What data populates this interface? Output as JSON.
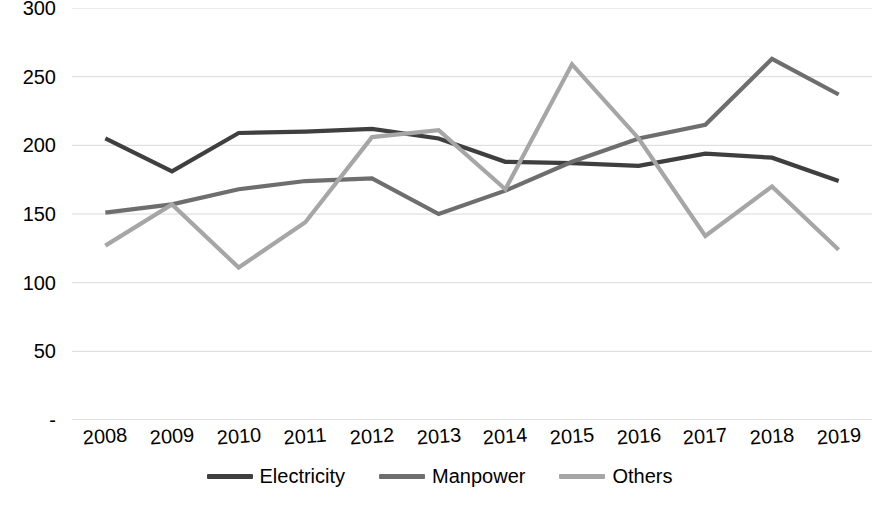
{
  "chart_data": {
    "type": "line",
    "title": "",
    "subtitle": "",
    "xlabel": "",
    "ylabel": "",
    "categories": [
      "2008",
      "2009",
      "2010",
      "2011",
      "2012",
      "2013",
      "2014",
      "2015",
      "2016",
      "2017",
      "2018",
      "2019"
    ],
    "series": [
      {
        "name": "Electricity",
        "color": "#3f3f3f",
        "values": [
          205,
          181,
          209,
          210,
          212,
          205,
          188,
          187,
          185,
          194,
          191,
          174
        ]
      },
      {
        "name": "Manpower",
        "color": "#6e6e6e",
        "values": [
          151,
          157,
          168,
          174,
          176,
          150,
          167,
          188,
          205,
          215,
          263,
          237
        ]
      },
      {
        "name": "Others",
        "color": "#a6a6a6",
        "values": [
          127,
          157,
          111,
          144,
          206,
          211,
          168,
          259,
          205,
          134,
          170,
          124
        ]
      }
    ],
    "ylim": [
      0,
      300
    ],
    "ytick_values": [
      300,
      250,
      200,
      150,
      100,
      50,
      0
    ],
    "ytick_labels": [
      "300",
      "250",
      "200",
      "150",
      "100",
      "50",
      "-"
    ],
    "grid": true,
    "grid_axis": "y",
    "grid_color": "#d9d9d9",
    "legend_position": "bottom",
    "background_color": "#ffffff",
    "text_color": "#000000"
  }
}
